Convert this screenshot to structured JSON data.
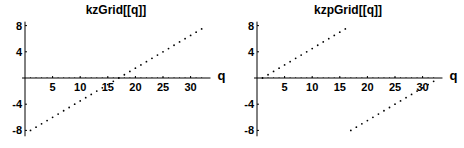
{
  "chart_data": [
    {
      "type": "scatter",
      "title": "kzGrid[[q]]",
      "xlabel": "q",
      "ylabel": "",
      "xlim": [
        0,
        33
      ],
      "ylim": [
        -8.5,
        8.5
      ],
      "xticks": [
        5,
        10,
        15,
        20,
        25,
        30
      ],
      "yticks": [
        8,
        4,
        -4,
        -8
      ],
      "grid": false,
      "x": [
        1,
        2,
        3,
        4,
        5,
        6,
        7,
        8,
        9,
        10,
        11,
        12,
        13,
        14,
        15,
        16,
        17,
        18,
        19,
        20,
        21,
        22,
        23,
        24,
        25,
        26,
        27,
        28,
        29,
        30,
        31,
        32
      ],
      "values": [
        -8,
        -7.5,
        -7,
        -6.5,
        -6,
        -5.5,
        -5,
        -4.5,
        -4,
        -3.5,
        -3,
        -2.5,
        -2,
        -1.5,
        -1,
        -0.5,
        0,
        0.5,
        1,
        1.5,
        2,
        2.5,
        3,
        3.5,
        4,
        4.5,
        5,
        5.5,
        6,
        6.5,
        7,
        7.5
      ]
    },
    {
      "type": "scatter",
      "title": "kzpGrid[[q]]",
      "xlabel": "q",
      "ylabel": "",
      "xlim": [
        0,
        33
      ],
      "ylim": [
        -8.5,
        8.5
      ],
      "xticks": [
        5,
        10,
        15,
        20,
        25,
        30
      ],
      "yticks": [
        8,
        4,
        -4,
        -8
      ],
      "grid": false,
      "x": [
        1,
        2,
        3,
        4,
        5,
        6,
        7,
        8,
        9,
        10,
        11,
        12,
        13,
        14,
        15,
        16,
        17,
        18,
        19,
        20,
        21,
        22,
        23,
        24,
        25,
        26,
        27,
        28,
        29,
        30,
        31,
        32
      ],
      "values": [
        0,
        0.5,
        1,
        1.5,
        2,
        2.5,
        3,
        3.5,
        4,
        4.5,
        5,
        5.5,
        6,
        6.5,
        7,
        7.5,
        -8,
        -7.5,
        -7,
        -6.5,
        -6,
        -5.5,
        -5,
        -4.5,
        -4,
        -3.5,
        -3,
        -2.5,
        -2,
        -1.5,
        -1,
        -0.5
      ]
    }
  ]
}
